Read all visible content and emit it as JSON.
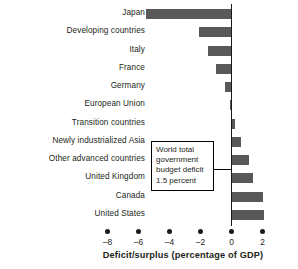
{
  "chart_data": {
    "type": "bar",
    "orientation": "horizontal",
    "title": "",
    "xlabel": "Deficit/surplus (percentage of GDP)",
    "ylabel": "",
    "xlim": [
      -9,
      3
    ],
    "xticks": [
      -8,
      -6,
      -4,
      -2,
      0,
      2
    ],
    "xtick_labels": [
      "–8",
      "–6",
      "–4",
      "–2",
      "0",
      "2"
    ],
    "grid": false,
    "legend": false,
    "zero_reference_line": 0,
    "categories": [
      "Japan",
      "Developing countries",
      "Italy",
      "France",
      "Germany",
      "European Union",
      "Transition countries",
      "Newly industrialized Asia",
      "Other advanced countries",
      "United Kingdom",
      "Canada",
      "United States"
    ],
    "values": [
      -5.5,
      -2.1,
      -1.5,
      -1.0,
      -0.4,
      -0.1,
      0.25,
      0.6,
      1.1,
      1.4,
      2.0,
      2.1
    ],
    "annotations": [
      {
        "text": "World total government budget deficit 1.5 percent",
        "lines": [
          "World total",
          "government",
          "budget deficit",
          "1.5 percent"
        ],
        "points_to": -1.5
      }
    ],
    "colors": {
      "bar": "#595959",
      "axis": "#1a1a1a",
      "text": "#231f20",
      "background": "#ffffff",
      "annotation_border": "#000000"
    }
  },
  "axis": {
    "title": "Deficit/surplus (percentage of GDP)"
  }
}
